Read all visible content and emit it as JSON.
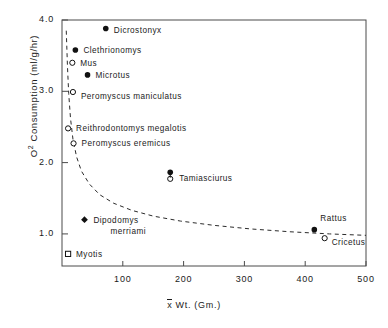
{
  "chart_data": {
    "type": "scatter",
    "title": "",
    "xlabel": "x̄ Wt. (Gm.)",
    "ylabel": "O2 Consumption (ml/g/hr)",
    "ylabel_base": "O",
    "ylabel_sup": "2",
    "ylabel_rest": " Consumption (ml/g/hr)",
    "xlabel_pre": "x",
    "xlabel_post": " Wt. (Gm.)",
    "xlim": [
      0,
      500
    ],
    "ylim": [
      0.55,
      4.0
    ],
    "xticks": [
      0,
      100,
      200,
      300,
      400,
      500
    ],
    "xticklabels": [
      "",
      "100",
      "200",
      "300",
      "400",
      "500"
    ],
    "yticks": [
      1.0,
      2.0,
      3.0,
      4.0
    ],
    "yticklabels": [
      "1.0",
      "2.0",
      "3.0",
      "4.0"
    ],
    "grid": false,
    "legend": "none",
    "marker_colors": {
      "filled": "#111111",
      "open": "#111111"
    },
    "curve": {
      "style": "dashed",
      "description": "fitted exponential decay of mass-specific O2 consumption vs body weight",
      "points": [
        {
          "x": 7,
          "y": 3.85
        },
        {
          "x": 9,
          "y": 3.35
        },
        {
          "x": 11,
          "y": 2.97
        },
        {
          "x": 14,
          "y": 2.62
        },
        {
          "x": 18,
          "y": 2.33
        },
        {
          "x": 24,
          "y": 2.08
        },
        {
          "x": 32,
          "y": 1.88
        },
        {
          "x": 45,
          "y": 1.7
        },
        {
          "x": 62,
          "y": 1.55
        },
        {
          "x": 85,
          "y": 1.43
        },
        {
          "x": 115,
          "y": 1.33
        },
        {
          "x": 150,
          "y": 1.25
        },
        {
          "x": 195,
          "y": 1.18
        },
        {
          "x": 250,
          "y": 1.12
        },
        {
          "x": 310,
          "y": 1.07
        },
        {
          "x": 375,
          "y": 1.03
        },
        {
          "x": 440,
          "y": 1.0
        },
        {
          "x": 500,
          "y": 0.98
        }
      ]
    },
    "points": [
      {
        "label": "Dicrostonyx",
        "x": 72,
        "y": 3.88,
        "marker": "filled-circle",
        "label_dx": 8,
        "label_dy": 3
      },
      {
        "label": "Clethrionomys",
        "x": 22,
        "y": 3.58,
        "marker": "filled-circle",
        "label_dx": 8,
        "label_dy": 2
      },
      {
        "label": "Mus",
        "x": 17,
        "y": 3.4,
        "marker": "open-circle",
        "label_dx": 8,
        "label_dy": 2
      },
      {
        "label": "Microtus",
        "x": 42,
        "y": 3.23,
        "marker": "filled-circle",
        "label_dx": 8,
        "label_dy": 2
      },
      {
        "label": "Peromyscus maniculatus",
        "x": 18,
        "y": 2.99,
        "marker": "open-circle",
        "label_dx": 8,
        "label_dy": 6
      },
      {
        "label": "Reithrodontomys megalotis",
        "x": 10,
        "y": 2.48,
        "marker": "open-circle",
        "label_dx": 8,
        "label_dy": 2
      },
      {
        "label": "Peromyscus eremicus",
        "x": 19,
        "y": 2.27,
        "marker": "open-circle",
        "label_dx": 8,
        "label_dy": 2
      },
      {
        "label": "Tamiasciurus",
        "x": 178,
        "y": 1.82,
        "marker": "filled-open-pair",
        "label_dx": 9,
        "label_dy": 5
      },
      {
        "label": "Dipodomys",
        "x": 37,
        "y": 1.2,
        "marker": "filled-diamond",
        "label_dx": 9,
        "label_dy": 2
      },
      {
        "label": "merriami",
        "x": 37,
        "y": 1.2,
        "marker": "none",
        "label_dx": 26,
        "label_dy": 13
      },
      {
        "label": "Rattus",
        "x": 415,
        "y": 1.06,
        "marker": "filled-circle",
        "label_dx": 6,
        "label_dy": -10
      },
      {
        "label": "Cricetus",
        "x": 432,
        "y": 0.94,
        "marker": "open-circle",
        "label_dx": 7,
        "label_dy": 6
      },
      {
        "label": "Myotis",
        "x": 10,
        "y": 0.72,
        "marker": "open-square",
        "label_dx": 8,
        "label_dy": 2
      }
    ]
  }
}
